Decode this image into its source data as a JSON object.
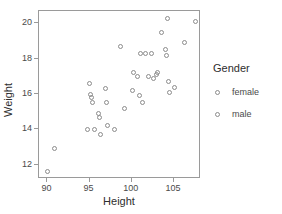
{
  "chart_data": {
    "type": "scatter",
    "title": "",
    "xlabel": "Height",
    "ylabel": "Weight",
    "xlim": [
      89.0,
      108.2
    ],
    "ylim": [
      11.2,
      20.7
    ],
    "xticks": [
      90,
      95,
      100,
      105
    ],
    "yticks": [
      12,
      14,
      16,
      18,
      20
    ],
    "grid": false,
    "legend": {
      "title": "Gender",
      "position": "right",
      "entries": [
        {
          "name": "female",
          "marker": "open-circle"
        },
        {
          "name": "male",
          "marker": "open-circle"
        }
      ]
    },
    "series": [
      {
        "name": "female",
        "marker": "open-circle",
        "points": [
          [
            90.0,
            11.6
          ],
          [
            90.8,
            12.9
          ],
          [
            94.8,
            14.0
          ],
          [
            95.0,
            16.6
          ],
          [
            95.1,
            16.0
          ],
          [
            95.2,
            15.8
          ],
          [
            95.3,
            15.5
          ],
          [
            95.6,
            14.0
          ],
          [
            96.0,
            14.9
          ],
          [
            96.2,
            14.7
          ],
          [
            96.3,
            13.7
          ],
          [
            96.9,
            16.3
          ],
          [
            97.0,
            15.5
          ],
          [
            97.1,
            14.2
          ],
          [
            98.0,
            14.0
          ],
          [
            99.1,
            15.2
          ],
          [
            100.1,
            16.2
          ],
          [
            100.9,
            15.9
          ],
          [
            101.3,
            15.5
          ]
        ]
      },
      {
        "name": "male",
        "marker": "open-circle",
        "points": [
          [
            98.7,
            18.7
          ],
          [
            100.2,
            17.2
          ],
          [
            100.7,
            17.0
          ],
          [
            101.0,
            18.3
          ],
          [
            101.6,
            18.3
          ],
          [
            102.0,
            17.0
          ],
          [
            102.3,
            18.3
          ],
          [
            102.6,
            16.9
          ],
          [
            102.9,
            17.1
          ],
          [
            103.0,
            17.2
          ],
          [
            103.5,
            19.5
          ],
          [
            104.0,
            18.5
          ],
          [
            104.1,
            18.2
          ],
          [
            104.2,
            20.3
          ],
          [
            104.4,
            16.7
          ],
          [
            104.5,
            16.1
          ],
          [
            105.0,
            16.4
          ],
          [
            106.2,
            18.9
          ],
          [
            107.6,
            20.1
          ]
        ]
      }
    ]
  }
}
